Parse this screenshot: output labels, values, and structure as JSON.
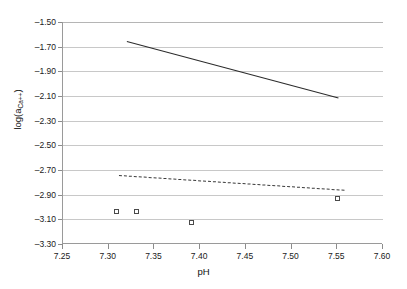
{
  "chart_data": {
    "type": "scatter",
    "title": "",
    "xlabel": "pH",
    "ylabel": "log(a_Ca++)",
    "ylabel_base": "log(a",
    "ylabel_sub": "Ca++",
    "ylabel_close": ")",
    "xlim": [
      7.25,
      7.6
    ],
    "ylim": [
      -3.3,
      -1.5
    ],
    "xticks": [
      "7.25",
      "7.30",
      "7.35",
      "7.40",
      "7.45",
      "7.50",
      "7.55",
      "7.60"
    ],
    "xtick_values": [
      7.25,
      7.3,
      7.35,
      7.4,
      7.45,
      7.5,
      7.55,
      7.6
    ],
    "yticks": [
      "-1.50",
      "-1.70",
      "-1.90",
      "-2.10",
      "-2.30",
      "-2.50",
      "-2.70",
      "-2.90",
      "-3.10",
      "-3.30"
    ],
    "ytick_values": [
      -1.5,
      -1.7,
      -1.9,
      -2.1,
      -2.3,
      -2.5,
      -2.7,
      -2.9,
      -3.1,
      -3.3
    ],
    "grid": true,
    "legend": "none",
    "series": [
      {
        "name": "solid-trend-line",
        "style": "solid",
        "color": "#2b2b2b",
        "x": [
          7.32,
          7.551
        ],
        "y": [
          -1.655,
          -2.112
        ]
      },
      {
        "name": "dashed-trend-line",
        "style": "dashed",
        "color": "#3a3a3a",
        "x": [
          7.311,
          7.558
        ],
        "y": [
          -2.742,
          -2.862
        ]
      },
      {
        "name": "measured-points",
        "style": "markers",
        "marker": "open-square",
        "color": "#4a4a4a",
        "x": [
          7.309,
          7.331,
          7.391,
          7.551
        ],
        "y": [
          -3.039,
          -3.039,
          -3.127,
          -2.934
        ]
      }
    ]
  }
}
